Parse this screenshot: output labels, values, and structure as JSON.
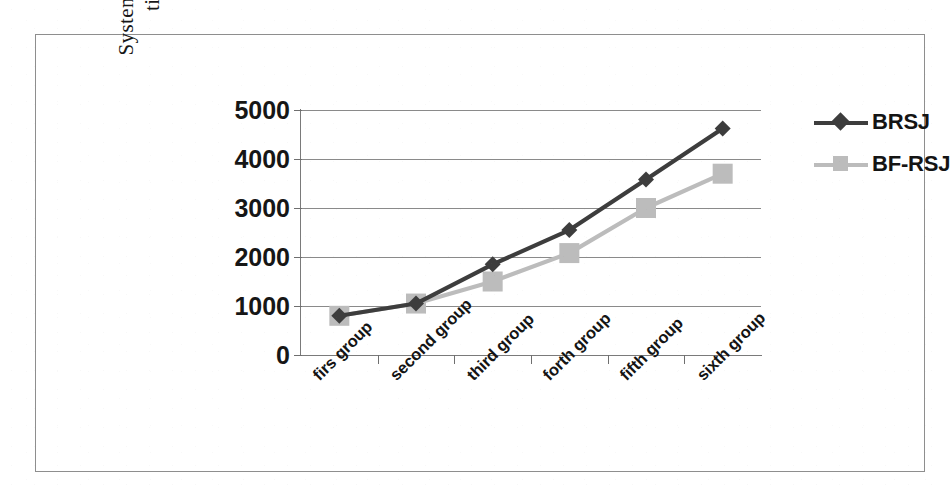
{
  "chart_data": {
    "type": "line",
    "title": "",
    "xlabel": "",
    "ylabel": "System execution\ntime(S)",
    "categories": [
      "firs group",
      "second group",
      "third group",
      "forth group",
      "fifth group",
      "sixth group"
    ],
    "series": [
      {
        "name": "BRSJ",
        "color": "#3d3d3d",
        "marker": "diamond",
        "values": [
          800,
          1050,
          1850,
          2550,
          3580,
          4620
        ]
      },
      {
        "name": "BF-RSJ",
        "color": "#bcbcbc",
        "marker": "square",
        "values": [
          800,
          1050,
          1500,
          2080,
          3000,
          3700
        ]
      }
    ],
    "ylim": [
      0,
      5000
    ],
    "ytick_labels": [
      "5000",
      "4000",
      "3000",
      "2000",
      "1000",
      "0"
    ],
    "ytick_values": [
      5000,
      4000,
      3000,
      2000,
      1000,
      0
    ],
    "grid": true,
    "legend_position": "right"
  },
  "legend": {
    "entries": [
      {
        "label": "BRSJ",
        "color": "#3d3d3d",
        "marker": "diamond-marker"
      },
      {
        "label": "BF-RSJ",
        "color": "#bcbcbc",
        "marker": "square-marker"
      }
    ]
  },
  "axes": {
    "y_title": "System execution\ntime(S)"
  }
}
